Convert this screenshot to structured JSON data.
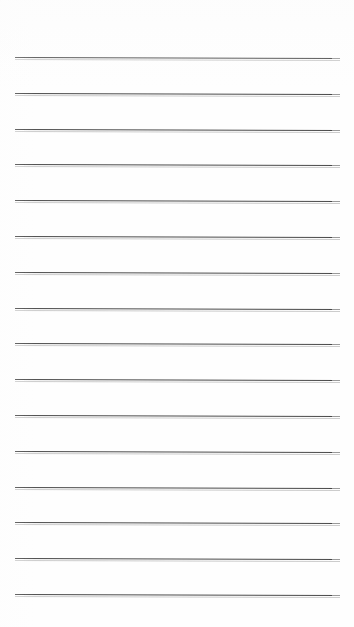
{
  "document": {
    "type": "lined-paper",
    "title": "Blank ruled notepad page",
    "background_color": "#fefefe",
    "rule_color": "#3a3a3a",
    "page_width_px": 354,
    "page_height_px": 627,
    "content_text": "",
    "handwriting_present": "no"
  },
  "rules": {
    "count": 16,
    "left_margin_px": 15,
    "right_edge_px": 340,
    "line_length_px": 325,
    "first_line_y_px": 57,
    "last_line_y_px": 594,
    "spacing_px": 35.8,
    "thickness_px": 1,
    "tilt_deg": 0.16,
    "y_positions": [
      57,
      92.8,
      128.6,
      164.4,
      200.2,
      236,
      271.8,
      307.6,
      343.4,
      379.2,
      415,
      450.8,
      486.6,
      522.4,
      558.2,
      594
    ]
  }
}
